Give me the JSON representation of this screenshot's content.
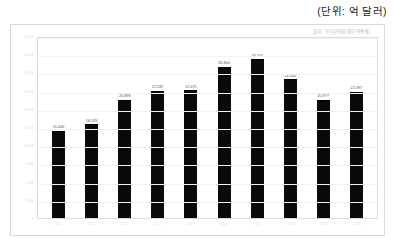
{
  "unit_note": "(단위: 억 달러)",
  "legend": "출처: 한국무역협회(무역통계)",
  "chart_data": {
    "type": "bar",
    "title": "",
    "subtitle": "",
    "xlabel": "",
    "ylabel": "",
    "legend_position": "top-right",
    "grid": true,
    "ylim": [
      0,
      30000
    ],
    "yticks": [
      "30,000",
      "27,000",
      "24,000",
      "21,000",
      "18,000",
      "15,000",
      "12,000",
      "9,000",
      "6,000",
      "3,000",
      "0"
    ],
    "categories": [
      "2011",
      "2012",
      "2013",
      "2014",
      "2015",
      "2016",
      "2017",
      "2018",
      "2019",
      "2020"
    ],
    "values": [
      15440,
      16529,
      20898,
      22587,
      22675,
      26804,
      28200,
      24560,
      20977,
      22397
    ],
    "value_labels": [
      "15,440",
      "16,529",
      "20,898",
      "22,587",
      "22,675",
      "26,804",
      "28,200",
      "24,560",
      "20,977",
      "22,397"
    ],
    "series": [
      {
        "name": "교역액",
        "color": "#0a0a0a",
        "values": [
          15440,
          16529,
          20898,
          22587,
          22675,
          26804,
          28200,
          24560,
          20977,
          22397
        ]
      }
    ]
  },
  "colors": {
    "bar": "#0a0a0a",
    "card_border": "#d8d8d8",
    "plot_border": "#dcdcdc",
    "grid": "#f2f2f2",
    "axis_text": "#dedede",
    "label_text": "#4a4a4a",
    "legend_text": "#b9b9b9"
  }
}
